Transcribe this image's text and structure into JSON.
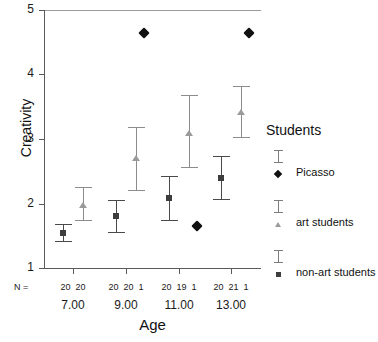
{
  "chart_data": {
    "type": "scatter",
    "title": "",
    "xlabel": "Age",
    "ylabel": "Creativity",
    "ylim": [
      1,
      5
    ],
    "yticks": [
      1,
      2,
      3,
      4,
      5
    ],
    "ytick_labels": [
      "1",
      "2",
      "3",
      "4",
      "5"
    ],
    "categories": [
      "7.00",
      "9.00",
      "11.00",
      "13.00"
    ],
    "grid": false,
    "legend_position": "right",
    "error_bar_type": "95% CI",
    "series": [
      {
        "name": "non-art students",
        "marker": "square",
        "color": "#3d3d3d",
        "values": [
          1.55,
          1.8,
          2.08,
          2.4
        ],
        "ci_low": [
          1.4,
          1.55,
          1.73,
          2.05
        ],
        "ci_high": [
          1.68,
          2.05,
          2.43,
          2.73
        ],
        "n": [
          20,
          20,
          20,
          20
        ]
      },
      {
        "name": "art students",
        "marker": "triangle",
        "color": "#9a9a9a",
        "values": [
          1.98,
          2.7,
          3.1,
          3.42
        ],
        "ci_low": [
          1.73,
          2.2,
          2.55,
          3.02
        ],
        "ci_high": [
          2.25,
          3.18,
          3.68,
          3.82
        ],
        "n": [
          20,
          20,
          19,
          21
        ]
      },
      {
        "name": "Picasso",
        "marker": "diamond",
        "color": "#111111",
        "values": [
          null,
          4.65,
          1.65,
          4.65
        ],
        "ci_low": [
          null,
          null,
          null,
          null
        ],
        "ci_high": [
          null,
          null,
          null,
          null
        ],
        "n": [
          null,
          1,
          1,
          1
        ]
      }
    ]
  },
  "axes": {
    "y_label": "Creativity",
    "x_label": "Age",
    "y_tick_labels": [
      "5",
      "4",
      "3",
      "2",
      "1"
    ],
    "x_tick_labels": [
      "7.00",
      "9.00",
      "11.00",
      "13.00"
    ]
  },
  "n_row": {
    "prefix": "N =",
    "groups": [
      [
        "20",
        "20"
      ],
      [
        "20",
        "20",
        "1"
      ],
      [
        "20",
        "19",
        "1"
      ],
      [
        "20",
        "21",
        "1"
      ]
    ]
  },
  "legend": {
    "title": "Students",
    "items": [
      {
        "label": "Picasso",
        "marker": "diamond-icon"
      },
      {
        "label": "art students",
        "marker": "triangle-icon"
      },
      {
        "label": "non-art students",
        "marker": "square-icon"
      }
    ]
  }
}
